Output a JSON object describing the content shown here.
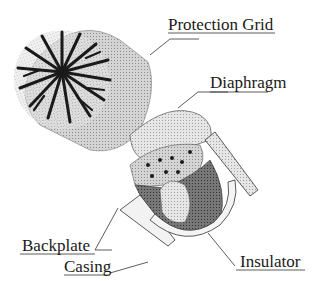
{
  "diagram": {
    "type": "exploded-view",
    "labels": {
      "protection_grid": "Protection Grid",
      "diaphragm": "Diaphragm",
      "backplate": "Backplate",
      "casing": "Casing",
      "insulator": "Insulator"
    }
  }
}
